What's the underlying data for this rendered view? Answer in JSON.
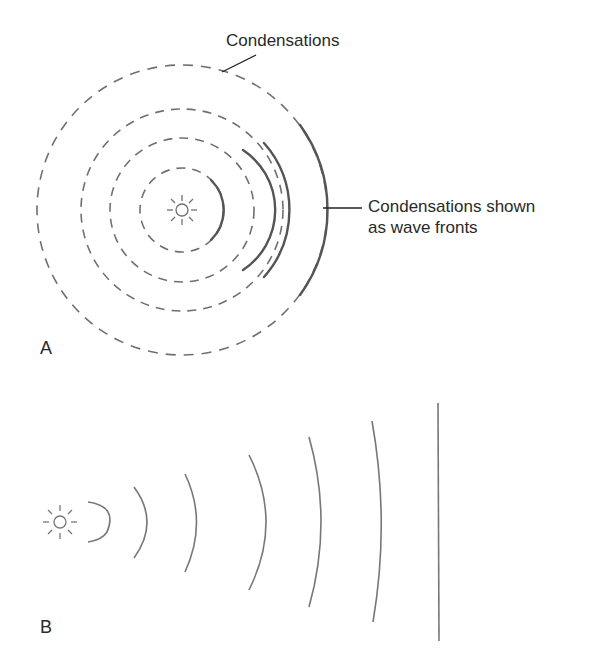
{
  "diagram_a": {
    "panel_label": "A",
    "callout_top": "Condensations",
    "callout_right_line1": "Condensations shown",
    "callout_right_line2": "as wave fronts",
    "icon": "sound-source-icon",
    "center": [
      182,
      210
    ],
    "radii": [
      42,
      72,
      101,
      145
    ],
    "stroke_color": "#6e6e6e",
    "wavefront_color": "#555555"
  },
  "diagram_b": {
    "panel_label": "B",
    "icon": "sound-source-icon",
    "source": [
      60,
      522
    ],
    "arcs_x": [
      107,
      148,
      196,
      265,
      320,
      382
    ],
    "plane_wave_x": 438,
    "stroke_color": "#777777"
  }
}
